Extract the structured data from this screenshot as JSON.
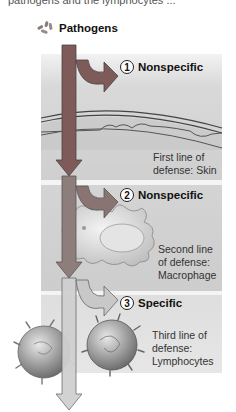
{
  "header": {
    "cut_text": "pathogens and the lymphocytes ...",
    "pathogens_label": "Pathogens",
    "pathogens_icon": "bacteria-icon"
  },
  "lines_of_defense": [
    {
      "number": "1",
      "type": "Nonspecific",
      "desc_lines": [
        "First line of",
        "defense: Skin"
      ],
      "illustration": "skin-layers"
    },
    {
      "number": "2",
      "type": "Nonspecific",
      "desc_lines": [
        "Second line",
        "of defense:",
        "Macrophage"
      ],
      "illustration": "macrophage"
    },
    {
      "number": "3",
      "type": "Specific",
      "desc_lines": [
        "Third line of",
        "defense:",
        "Lymphocytes"
      ],
      "illustration": "lymphocytes"
    }
  ],
  "colors": {
    "arrow_top": "#8a5a55",
    "arrow_bottom": "#c8c8c8",
    "arrow_outline": "#555555",
    "panel_bg": "#d4d4d4",
    "separator": "#f4f4f4"
  }
}
